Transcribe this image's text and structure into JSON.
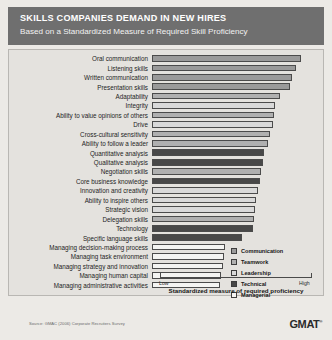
{
  "header": {
    "title": "SKILLS COMPANIES DEMAND IN NEW HIRES",
    "subtitle": "Based on a Standardized Measure of Required Skill Proficiency",
    "band_color": "#6f6f6f"
  },
  "footer": {
    "source": "Source: GMAC (2006) Corporate Recruiters Survey",
    "logo": "GMAT",
    "logo_mark": "®"
  },
  "legend": {
    "position": "inside-right",
    "items": [
      {
        "label": "Communication",
        "color": "#9a9a9a"
      },
      {
        "label": "Teamwork",
        "color": "#b0b0b0"
      },
      {
        "label": "Leadership",
        "color": "#d9d9d9"
      },
      {
        "label": "Technical",
        "color": "#484848"
      },
      {
        "label": "Managerial",
        "color": "#f4f4f2"
      }
    ]
  },
  "axis": {
    "low_label": "Low",
    "high_label": "High",
    "title": "Standardized measure of required proficiency"
  },
  "chart_data": {
    "type": "bar",
    "orientation": "horizontal",
    "title": "SKILLS COMPANIES DEMAND IN NEW HIRES",
    "subtitle": "Based on a Standardized Measure of Required Skill Proficiency",
    "xlabel": "Standardized measure of required proficiency",
    "ylabel": "",
    "xlim": [
      0,
      100
    ],
    "xticks": [
      "Low",
      "High"
    ],
    "grid": false,
    "legend_position": "inside-right",
    "legend_entries": [
      "Communication",
      "Teamwork",
      "Leadership",
      "Technical",
      "Managerial"
    ],
    "categories": [
      "Oral communication",
      "Listening skills",
      "Written communication",
      "Presentation skills",
      "Adaptability",
      "Integrity",
      "Ability to value opinions of others",
      "Drive",
      "Cross-cultural sensitivity",
      "Ability to follow a leader",
      "Quantitative analysis",
      "Qualitative analysis",
      "Negotiation skills",
      "Core business knowledge",
      "Innovation and creativity",
      "Ability to inspire others",
      "Strategic vision",
      "Delegation skills",
      "Technology",
      "Specific language skills",
      "Managing decision-making process",
      "Managing task environment",
      "Managing strategy and innovation",
      "Managing human capital",
      "Managing administrative activities"
    ],
    "values": [
      98.0,
      94.5,
      92.0,
      90.5,
      84.5,
      81.0,
      80.5,
      79.5,
      77.5,
      76.5,
      73.5,
      73.0,
      72.0,
      71.0,
      69.5,
      68.5,
      68.0,
      67.0,
      66.5,
      59.5,
      48.0,
      47.5,
      47.0,
      45.5,
      45.0
    ],
    "series_assignment": [
      "Communication",
      "Communication",
      "Communication",
      "Communication",
      "Teamwork",
      "Leadership",
      "Teamwork",
      "Leadership",
      "Teamwork",
      "Teamwork",
      "Technical",
      "Technical",
      "Teamwork",
      "Technical",
      "Leadership",
      "Leadership",
      "Leadership",
      "Teamwork",
      "Technical",
      "Technical",
      "Managerial",
      "Managerial",
      "Managerial",
      "Managerial",
      "Managerial"
    ]
  }
}
